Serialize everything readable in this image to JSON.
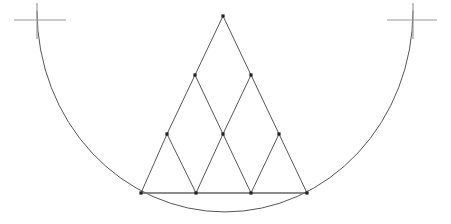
{
  "figure": {
    "name": "subdivided-triangle-inscribed-in-arc",
    "width": 451,
    "height": 224,
    "background_color": "#ffffff",
    "stroke_colors": {
      "arc": "#555555",
      "triangle": "#555555",
      "baseline": "#666666",
      "tick_cross": "#9a9a9a",
      "vertex_dot": "#222222"
    },
    "stroke_widths": {
      "arc": 1,
      "triangle": 1,
      "baseline": 1.4,
      "tick_cross": 1.2
    },
    "vertex_dot_size": 3.2
  },
  "arc": {
    "label": "circular-arc",
    "start": {
      "x": 37,
      "y": 11
    },
    "end": {
      "x": 413,
      "y": 11
    },
    "lowest_point": {
      "x": 225,
      "y": 212
    },
    "radius_x": 188,
    "radius_y": 201,
    "sweep": "clockwise-downward",
    "path": "M 37 11 A 188 201 0 0 0 413 11"
  },
  "tick_marks": [
    {
      "label": "left-tick-cross",
      "center": {
        "x": 37,
        "y": 20
      },
      "vertical": {
        "x": 37,
        "y1": 3,
        "y2": 39
      },
      "horizontal": {
        "y": 20,
        "x1": 14,
        "x2": 66
      }
    },
    {
      "label": "right-tick-cross",
      "center": {
        "x": 413,
        "y": 20
      },
      "vertical": {
        "x": 413,
        "y1": 3,
        "y2": 39
      },
      "horizontal": {
        "y": 20,
        "x1": 387,
        "x2": 437
      }
    }
  ],
  "triangle": {
    "label": "subdivided-equilateral-triangle",
    "subdivisions": 3,
    "apex": {
      "x": 223,
      "y": 16
    },
    "base_left": {
      "x": 141,
      "y": 193
    },
    "base_right": {
      "x": 307,
      "y": 193
    },
    "side_length": 166,
    "rows": [
      {
        "row": 0,
        "name": "apex-row",
        "points": [
          {
            "id": "p0",
            "x": 223,
            "y": 16
          }
        ]
      },
      {
        "row": 1,
        "name": "upper-midpoint-row",
        "points": [
          {
            "id": "p1",
            "x": 195,
            "y": 75
          },
          {
            "id": "p2",
            "x": 251,
            "y": 75
          }
        ]
      },
      {
        "row": 2,
        "name": "lower-midpoint-row",
        "points": [
          {
            "id": "p3",
            "x": 167,
            "y": 134
          },
          {
            "id": "p4",
            "x": 223,
            "y": 134
          },
          {
            "id": "p5",
            "x": 279,
            "y": 134
          }
        ]
      },
      {
        "row": 3,
        "name": "base-row",
        "points": [
          {
            "id": "p6",
            "x": 141,
            "y": 193
          },
          {
            "id": "p7",
            "x": 196,
            "y": 193
          },
          {
            "id": "p8",
            "x": 251,
            "y": 193
          },
          {
            "id": "p9",
            "x": 307,
            "y": 193
          }
        ]
      }
    ],
    "edges": [
      {
        "from": "p0",
        "to": "p1",
        "kind": "left-side"
      },
      {
        "from": "p1",
        "to": "p3",
        "kind": "left-side"
      },
      {
        "from": "p3",
        "to": "p6",
        "kind": "left-side"
      },
      {
        "from": "p0",
        "to": "p2",
        "kind": "right-side"
      },
      {
        "from": "p2",
        "to": "p5",
        "kind": "right-side"
      },
      {
        "from": "p5",
        "to": "p9",
        "kind": "right-side"
      },
      {
        "from": "p1",
        "to": "p4",
        "kind": "inner-right-lean"
      },
      {
        "from": "p4",
        "to": "p8",
        "kind": "inner-right-lean"
      },
      {
        "from": "p2",
        "to": "p4",
        "kind": "inner-left-lean"
      },
      {
        "from": "p4",
        "to": "p7",
        "kind": "inner-left-lean"
      },
      {
        "from": "p3",
        "to": "p7",
        "kind": "inner-right-lean"
      },
      {
        "from": "p5",
        "to": "p8",
        "kind": "inner-left-lean"
      }
    ],
    "base_line": {
      "label": "triangle-base-chord",
      "from": {
        "x": 141,
        "y": 193
      },
      "to": {
        "x": 307,
        "y": 193
      }
    }
  }
}
